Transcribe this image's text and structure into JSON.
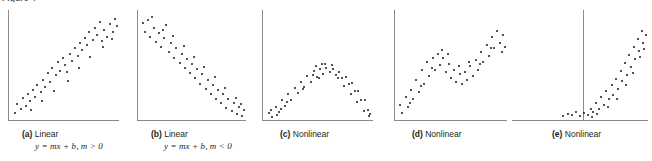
{
  "figure": {
    "label": "Figure 4",
    "panel_count": 5
  },
  "panels": [
    {
      "id": "a",
      "tag": "(a)",
      "title": "Linear",
      "equation": "y = mx + b, m > 0",
      "has_vertical_divider": false
    },
    {
      "id": "b",
      "tag": "(b)",
      "title": "Linear",
      "equation": "y = mx + b, m < 0",
      "has_vertical_divider": false
    },
    {
      "id": "c",
      "tag": "(c)",
      "title": "Nonlinear",
      "equation": "",
      "has_vertical_divider": false
    },
    {
      "id": "d",
      "tag": "(d)",
      "title": "Nonlinear",
      "equation": "",
      "has_vertical_divider": false
    },
    {
      "id": "e",
      "tag": "(e)",
      "title": "Nonlinear",
      "equation": "",
      "has_vertical_divider": true
    }
  ],
  "colors": {
    "axis": "#8a8a8d",
    "dot": "#1a1a1a",
    "text": "#231f20",
    "background": "#ffffff"
  },
  "chart_data": [
    {
      "type": "scatter",
      "title": "Linear",
      "subtitle": "y = mx + b, m > 0",
      "panel": "a",
      "xlabel": "",
      "ylabel": "",
      "xlim": [
        0,
        100
      ],
      "ylim": [
        0,
        100
      ],
      "grid": false,
      "legend": "none",
      "points": [
        [
          3,
          6
        ],
        [
          5,
          14
        ],
        [
          8,
          10
        ],
        [
          10,
          20
        ],
        [
          13,
          13
        ],
        [
          15,
          24
        ],
        [
          17,
          17
        ],
        [
          20,
          28
        ],
        [
          22,
          21
        ],
        [
          24,
          33
        ],
        [
          27,
          26
        ],
        [
          29,
          38
        ],
        [
          31,
          31
        ],
        [
          34,
          44
        ],
        [
          36,
          36
        ],
        [
          38,
          49
        ],
        [
          41,
          42
        ],
        [
          43,
          55
        ],
        [
          45,
          46
        ],
        [
          48,
          59
        ],
        [
          50,
          52
        ],
        [
          52,
          45
        ],
        [
          55,
          63
        ],
        [
          57,
          56
        ],
        [
          59,
          68
        ],
        [
          62,
          61
        ],
        [
          64,
          73
        ],
        [
          66,
          66
        ],
        [
          69,
          78
        ],
        [
          71,
          71
        ],
        [
          73,
          84
        ],
        [
          76,
          76
        ],
        [
          78,
          88
        ],
        [
          80,
          81
        ],
        [
          83,
          93
        ],
        [
          85,
          75
        ],
        [
          87,
          86
        ],
        [
          90,
          79
        ],
        [
          92,
          91
        ],
        [
          95,
          84
        ],
        [
          97,
          96
        ],
        [
          99,
          89
        ],
        [
          18,
          9
        ],
        [
          28,
          17
        ],
        [
          40,
          27
        ],
        [
          53,
          37
        ],
        [
          63,
          49
        ],
        [
          74,
          60
        ],
        [
          86,
          69
        ],
        [
          94,
          77
        ]
      ]
    },
    {
      "type": "scatter",
      "title": "Linear",
      "subtitle": "y = mx + b, m < 0",
      "panel": "b",
      "xlabel": "",
      "ylabel": "",
      "xlim": [
        0,
        100
      ],
      "ylim": [
        0,
        100
      ],
      "grid": false,
      "legend": "none",
      "points": [
        [
          2,
          92
        ],
        [
          4,
          84
        ],
        [
          7,
          95
        ],
        [
          9,
          79
        ],
        [
          12,
          88
        ],
        [
          14,
          74
        ],
        [
          17,
          83
        ],
        [
          19,
          69
        ],
        [
          22,
          78
        ],
        [
          24,
          90
        ],
        [
          27,
          64
        ],
        [
          29,
          73
        ],
        [
          32,
          59
        ],
        [
          34,
          68
        ],
        [
          37,
          54
        ],
        [
          39,
          63
        ],
        [
          42,
          49
        ],
        [
          44,
          58
        ],
        [
          47,
          44
        ],
        [
          49,
          53
        ],
        [
          52,
          39
        ],
        [
          54,
          48
        ],
        [
          57,
          34
        ],
        [
          59,
          43
        ],
        [
          62,
          29
        ],
        [
          64,
          38
        ],
        [
          67,
          24
        ],
        [
          69,
          33
        ],
        [
          72,
          19
        ],
        [
          74,
          28
        ],
        [
          77,
          15
        ],
        [
          79,
          24
        ],
        [
          82,
          11
        ],
        [
          84,
          19
        ],
        [
          87,
          8
        ],
        [
          89,
          15
        ],
        [
          92,
          5
        ],
        [
          94,
          12
        ],
        [
          97,
          3
        ],
        [
          99,
          9
        ],
        [
          11,
          98
        ],
        [
          21,
          86
        ],
        [
          31,
          80
        ],
        [
          41,
          70
        ],
        [
          51,
          60
        ],
        [
          61,
          50
        ],
        [
          71,
          40
        ],
        [
          81,
          30
        ],
        [
          91,
          20
        ],
        [
          96,
          14
        ]
      ]
    },
    {
      "type": "scatter",
      "title": "Nonlinear",
      "subtitle": "inverted parabola / arch",
      "panel": "c",
      "xlabel": "",
      "ylabel": "",
      "xlim": [
        0,
        100
      ],
      "ylim": [
        0,
        100
      ],
      "grid": false,
      "legend": "none",
      "points": [
        [
          3,
          8
        ],
        [
          6,
          3
        ],
        [
          9,
          16
        ],
        [
          12,
          9
        ],
        [
          15,
          24
        ],
        [
          18,
          17
        ],
        [
          21,
          32
        ],
        [
          24,
          25
        ],
        [
          27,
          40
        ],
        [
          30,
          33
        ],
        [
          33,
          48
        ],
        [
          36,
          41
        ],
        [
          39,
          55
        ],
        [
          42,
          48
        ],
        [
          45,
          61
        ],
        [
          48,
          54
        ],
        [
          51,
          64
        ],
        [
          54,
          58
        ],
        [
          57,
          66
        ],
        [
          60,
          60
        ],
        [
          63,
          64
        ],
        [
          66,
          57
        ],
        [
          69,
          60
        ],
        [
          72,
          52
        ],
        [
          75,
          54
        ],
        [
          78,
          45
        ],
        [
          81,
          46
        ],
        [
          84,
          36
        ],
        [
          87,
          36
        ],
        [
          90,
          25
        ],
        [
          93,
          24
        ],
        [
          96,
          12
        ],
        [
          98,
          6
        ],
        [
          5,
          12
        ],
        [
          20,
          22
        ],
        [
          35,
          38
        ],
        [
          50,
          52
        ],
        [
          56,
          71
        ],
        [
          62,
          69
        ],
        [
          68,
          52
        ],
        [
          74,
          43
        ],
        [
          80,
          32
        ],
        [
          86,
          22
        ],
        [
          92,
          10
        ],
        [
          97,
          4
        ],
        [
          10,
          5
        ],
        [
          14,
          13
        ],
        [
          44,
          56
        ],
        [
          47,
          68
        ],
        [
          53,
          70
        ]
      ]
    },
    {
      "type": "scatter",
      "title": "Nonlinear",
      "subtitle": "wave: rise, dip, rise",
      "panel": "d",
      "xlabel": "",
      "ylabel": "",
      "xlim": [
        0,
        100
      ],
      "ylim": [
        0,
        100
      ],
      "grid": false,
      "legend": "none",
      "points": [
        [
          2,
          14
        ],
        [
          4,
          6
        ],
        [
          7,
          22
        ],
        [
          9,
          12
        ],
        [
          12,
          30
        ],
        [
          14,
          20
        ],
        [
          17,
          40
        ],
        [
          19,
          28
        ],
        [
          22,
          50
        ],
        [
          24,
          36
        ],
        [
          27,
          58
        ],
        [
          29,
          44
        ],
        [
          32,
          62
        ],
        [
          34,
          50
        ],
        [
          37,
          66
        ],
        [
          39,
          55
        ],
        [
          42,
          62
        ],
        [
          44,
          48
        ],
        [
          47,
          56
        ],
        [
          49,
          42
        ],
        [
          52,
          50
        ],
        [
          54,
          38
        ],
        [
          57,
          46
        ],
        [
          59,
          36
        ],
        [
          62,
          48
        ],
        [
          64,
          40
        ],
        [
          67,
          54
        ],
        [
          69,
          44
        ],
        [
          72,
          60
        ],
        [
          74,
          50
        ],
        [
          77,
          68
        ],
        [
          79,
          58
        ],
        [
          82,
          76
        ],
        [
          84,
          64
        ],
        [
          87,
          84
        ],
        [
          89,
          72
        ],
        [
          92,
          90
        ],
        [
          94,
          78
        ],
        [
          97,
          86
        ],
        [
          99,
          74
        ],
        [
          11,
          16
        ],
        [
          21,
          34
        ],
        [
          31,
          52
        ],
        [
          41,
          70
        ],
        [
          46,
          66
        ],
        [
          56,
          54
        ],
        [
          66,
          58
        ],
        [
          76,
          56
        ],
        [
          86,
          72
        ],
        [
          96,
          68
        ]
      ]
    },
    {
      "type": "scatter",
      "title": "Nonlinear",
      "subtitle": "flat then exponential rise with vertical reference line",
      "panel": "e",
      "xlabel": "",
      "ylabel": "",
      "xlim": [
        0,
        100
      ],
      "ylim": [
        0,
        100
      ],
      "grid": false,
      "legend": "none",
      "vertical_line_x": 52,
      "points": [
        [
          36,
          3
        ],
        [
          40,
          5
        ],
        [
          43,
          4
        ],
        [
          46,
          7
        ],
        [
          49,
          3
        ],
        [
          52,
          6
        ],
        [
          55,
          4
        ],
        [
          57,
          10
        ],
        [
          59,
          7
        ],
        [
          61,
          16
        ],
        [
          63,
          10
        ],
        [
          65,
          22
        ],
        [
          67,
          14
        ],
        [
          69,
          28
        ],
        [
          71,
          20
        ],
        [
          73,
          34
        ],
        [
          74,
          24
        ],
        [
          76,
          40
        ],
        [
          78,
          30
        ],
        [
          80,
          48
        ],
        [
          81,
          38
        ],
        [
          83,
          56
        ],
        [
          85,
          44
        ],
        [
          86,
          64
        ],
        [
          88,
          52
        ],
        [
          90,
          72
        ],
        [
          91,
          60
        ],
        [
          93,
          80
        ],
        [
          94,
          68
        ],
        [
          96,
          88
        ],
        [
          97,
          76
        ],
        [
          99,
          84
        ],
        [
          58,
          2
        ],
        [
          62,
          5
        ],
        [
          70,
          12
        ],
        [
          77,
          20
        ],
        [
          84,
          34
        ],
        [
          89,
          46
        ],
        [
          95,
          62
        ],
        [
          98,
          70
        ]
      ]
    }
  ]
}
